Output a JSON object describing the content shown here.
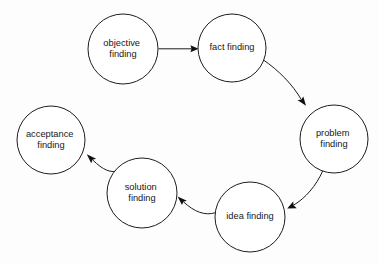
{
  "diagram": {
    "type": "cycle-flow-diagram",
    "canvas": {
      "width": 379,
      "height": 265,
      "background": "#fdfdfd"
    },
    "style": {
      "node_shape": "circle",
      "node_fill": "#ffffff",
      "node_stroke": "#1d1d1d",
      "edge_stroke": "#1d1d1d",
      "label_color": "#171717"
    },
    "nodes": [
      {
        "id": "objective-finding",
        "label_line1": "objective",
        "label_line2": "finding",
        "cx": 123,
        "cy": 49,
        "r": 35
      },
      {
        "id": "fact-finding",
        "label_line1": "fact finding",
        "label_line2": "",
        "cx": 232,
        "cy": 48,
        "r": 34
      },
      {
        "id": "problem-finding",
        "label_line1": "problem",
        "label_line2": "finding",
        "cx": 334,
        "cy": 139,
        "r": 34
      },
      {
        "id": "idea-finding",
        "label_line1": "idea finding",
        "label_line2": "",
        "cx": 250,
        "cy": 217,
        "r": 35
      },
      {
        "id": "solution-finding",
        "label_line1": "solution",
        "label_line2": "finding",
        "cx": 142,
        "cy": 193,
        "r": 35
      },
      {
        "id": "acceptance-finding",
        "label_line1": "acceptance",
        "label_line2": "finding",
        "cx": 51,
        "cy": 140,
        "r": 34
      }
    ],
    "edges": [
      {
        "id": "edge-objective-to-fact",
        "from": "objective-finding",
        "to": "fact-finding",
        "style": "straight"
      },
      {
        "id": "edge-fact-to-problem",
        "from": "fact-finding",
        "to": "problem-finding",
        "style": "curved"
      },
      {
        "id": "edge-problem-to-idea",
        "from": "problem-finding",
        "to": "idea-finding",
        "style": "curved"
      },
      {
        "id": "edge-idea-to-solution",
        "from": "idea-finding",
        "to": "solution-finding",
        "style": "curved"
      },
      {
        "id": "edge-solution-to-acceptance",
        "from": "solution-finding",
        "to": "acceptance-finding",
        "style": "curved"
      }
    ]
  }
}
